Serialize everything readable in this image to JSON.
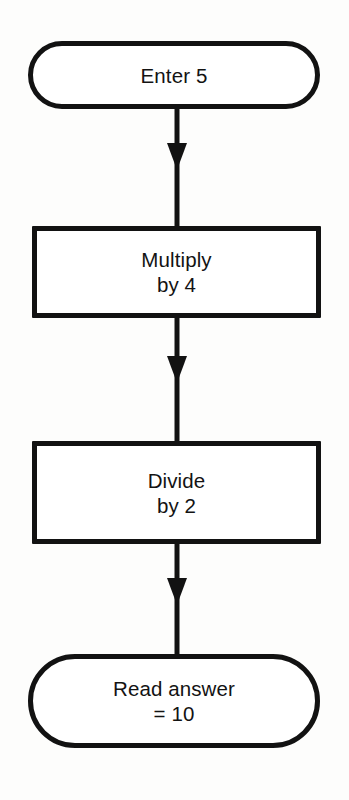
{
  "diagram": {
    "background_color": "#fdfdfc",
    "stroke_color": "#121212",
    "fill_color": "#ffffff",
    "text_color": "#131313",
    "orientation": "vertical-top-to-bottom",
    "nodes": [
      {
        "id": "enter",
        "shape": "terminator",
        "label": "Enter 5",
        "operation": "input",
        "value": 5
      },
      {
        "id": "multiply",
        "shape": "process",
        "label": "Multiply\nby 4",
        "operation": "multiply",
        "operand": 4
      },
      {
        "id": "divide",
        "shape": "process",
        "label": "Divide\nby 2",
        "operation": "divide",
        "operand": 2
      },
      {
        "id": "read",
        "shape": "terminator",
        "label": "Read answer\n= 10",
        "operation": "output",
        "value": 10
      }
    ],
    "edges": [
      {
        "id": "edge-enter-multiply",
        "from": "enter",
        "to": "multiply",
        "arrow": "down",
        "label": ""
      },
      {
        "id": "edge-multiply-divide",
        "from": "multiply",
        "to": "divide",
        "arrow": "down",
        "label": ""
      },
      {
        "id": "edge-divide-read",
        "from": "divide",
        "to": "read",
        "arrow": "down",
        "label": ""
      }
    ]
  }
}
